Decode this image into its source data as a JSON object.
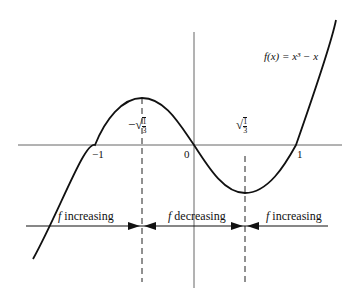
{
  "figure": {
    "function_label": "f(x) = x³ − x",
    "x_ticks": [
      {
        "label": "−1",
        "x": -1
      },
      {
        "label": "0",
        "x": 0
      },
      {
        "label": "1",
        "x": 1
      }
    ],
    "critical_points": [
      {
        "label": "−√(1/3)",
        "prefix": "−",
        "radicand_num": "1",
        "radicand_den": "3",
        "x": -0.577
      },
      {
        "label": "√(1/3)",
        "prefix": "",
        "radicand_num": "1",
        "radicand_den": "3",
        "x": 0.577
      }
    ],
    "intervals": [
      {
        "label": "f increasing",
        "f": "f",
        "text": "increasing"
      },
      {
        "label": "f decreasing",
        "f": "f",
        "text": "decreasing"
      },
      {
        "label": "f increasing",
        "f": "f",
        "text": "increasing"
      }
    ],
    "colors": {
      "ink": "#111111",
      "axis": "#555555"
    }
  }
}
